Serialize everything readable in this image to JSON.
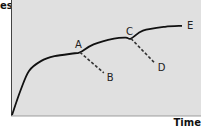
{
  "chart_data": {
    "type": "line",
    "title": "",
    "xlabel": "Time",
    "ylabel": "Sales",
    "ylabel_visible": "es",
    "background": "#e0e0e0",
    "grid": false,
    "main_curve": {
      "name": "Sales curve",
      "style": "solid",
      "points": [
        [
          0,
          0
        ],
        [
          5,
          25
        ],
        [
          10,
          45
        ],
        [
          17,
          55
        ],
        [
          25,
          60
        ],
        [
          37,
          63
        ],
        [
          40,
          64
        ],
        [
          48,
          72
        ],
        [
          60,
          78
        ],
        [
          67,
          79
        ],
        [
          70,
          78
        ],
        [
          77,
          86
        ],
        [
          90,
          90
        ],
        [
          100,
          91
        ]
      ]
    },
    "branches": [
      {
        "name": "A-B decline",
        "style": "dashed",
        "from": "A",
        "to": "B",
        "points": [
          [
            40,
            64
          ],
          [
            54,
            43
          ]
        ]
      },
      {
        "name": "C-D decline",
        "style": "dashed",
        "from": "C",
        "to": "D",
        "points": [
          [
            70,
            78
          ],
          [
            84,
            53
          ]
        ]
      }
    ],
    "annotations": [
      {
        "label": "A",
        "x": 40,
        "y": 64
      },
      {
        "label": "B",
        "x": 54,
        "y": 43
      },
      {
        "label": "C",
        "x": 70,
        "y": 78
      },
      {
        "label": "D",
        "x": 84,
        "y": 53
      },
      {
        "label": "E",
        "x": 100,
        "y": 91
      }
    ],
    "xlim": [
      0,
      100
    ],
    "ylim": [
      0,
      100
    ]
  }
}
